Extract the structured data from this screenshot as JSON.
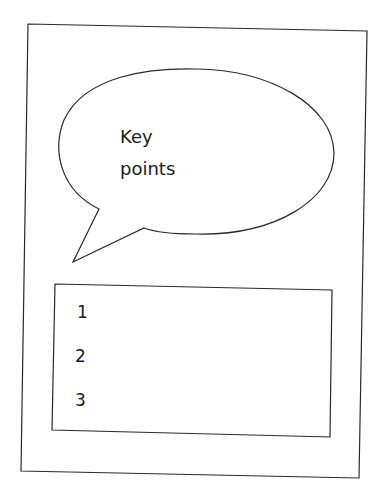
{
  "diagram": {
    "bubble": {
      "line1": "Key",
      "line2": "points"
    },
    "list": {
      "items": [
        {
          "label": "1"
        },
        {
          "label": "2"
        },
        {
          "label": "3"
        }
      ]
    },
    "colors": {
      "stroke": "#2a2a2a",
      "background": "#ffffff",
      "text": "#1a1a1a"
    }
  }
}
